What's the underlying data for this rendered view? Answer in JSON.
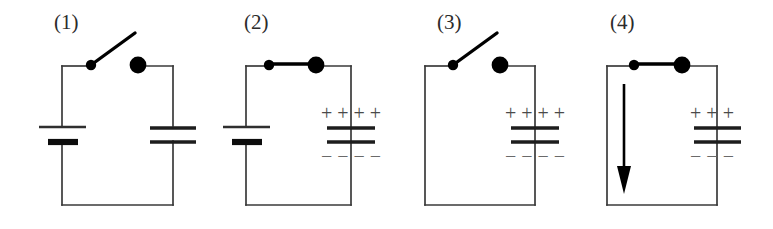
{
  "figure": {
    "background_color": "#ffffff",
    "wire_color": "#3a3a3a",
    "sign_color": "#4a4a4a",
    "width": 773,
    "height": 229
  },
  "panels": [
    {
      "label": "(1)",
      "switch_state": "open",
      "has_battery": true,
      "has_capacitor": true,
      "plus_signs": "",
      "minus_signs": "",
      "plus_count": 0,
      "minus_count": 0,
      "current_arrow": false
    },
    {
      "label": "(2)",
      "switch_state": "closed",
      "has_battery": true,
      "has_capacitor": true,
      "plus_signs": "+ + + +",
      "minus_signs": "− − − −",
      "plus_count": 4,
      "minus_count": 4,
      "current_arrow": false
    },
    {
      "label": "(3)",
      "switch_state": "open",
      "has_battery": false,
      "has_capacitor": true,
      "plus_signs": "+ + + +",
      "minus_signs": "− − − −",
      "plus_count": 4,
      "minus_count": 4,
      "current_arrow": false
    },
    {
      "label": "(4)",
      "switch_state": "closed",
      "has_battery": false,
      "has_capacitor": true,
      "plus_signs": "+ + +",
      "minus_signs": "− − −",
      "plus_count": 3,
      "minus_count": 3,
      "current_arrow": true
    }
  ],
  "signs": {
    "plus_glyph": "+",
    "minus_glyph": "−"
  }
}
